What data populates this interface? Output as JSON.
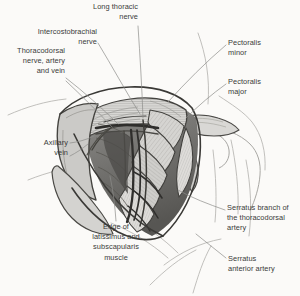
{
  "figure": {
    "style": "grayscale pen-and-ink medical illustration",
    "background_color": "#fbfaf8",
    "ink_color": "#3a3a38",
    "leader_line_color": "#8d8d8a",
    "fill_light": "#e3e2e0",
    "fill_mid": "#c9c8c5",
    "fill_dark": "#a9a8a5",
    "fill_deep": "#6f6e6b"
  },
  "labels": [
    {
      "id": "long-thoracic-nerve",
      "text": "Long thoracic\nnerve",
      "align": "right",
      "x": 86,
      "y": 2,
      "w": 52
    },
    {
      "id": "intercostobrachial-nerve",
      "text": "Intercostobrachial\nnerve",
      "align": "right",
      "x": 27,
      "y": 27,
      "w": 70
    },
    {
      "id": "thoracodorsal-nerve-artery-vein",
      "text": "Thoracodorsal\nnerve, artery\nand vein",
      "align": "right",
      "x": 3,
      "y": 46,
      "w": 62
    },
    {
      "id": "pectoralis-minor",
      "text": "Pectoralis\nminor",
      "align": "left",
      "x": 228,
      "y": 38,
      "w": 56
    },
    {
      "id": "pectoralis-major",
      "text": "Pectoralis\nmajor",
      "align": "left",
      "x": 228,
      "y": 77,
      "w": 56
    },
    {
      "id": "axillary-vein",
      "text": "Axillary\nvein",
      "align": "right",
      "x": 28,
      "y": 138,
      "w": 40
    },
    {
      "id": "serratus-branch-thoracodorsal-artery",
      "text": "Serratus branch of\nthe thoracodorsal\nartery",
      "align": "left",
      "x": 227,
      "y": 203,
      "w": 72
    },
    {
      "id": "edge-latissimus-subscapularis-muscle",
      "text": "Edge of\nlatissimus and\nsubscapularis\nmuscle",
      "align": "center",
      "x": 84,
      "y": 222,
      "w": 64
    },
    {
      "id": "serratus-anterior-artery",
      "text": "Serratus\nanterior artery",
      "align": "left",
      "x": 228,
      "y": 254,
      "w": 68
    }
  ]
}
